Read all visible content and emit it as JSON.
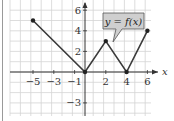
{
  "chart_data": {
    "type": "line",
    "title": "",
    "xlabel": "x",
    "ylabel": "",
    "annotation": "y = f(x)",
    "x": [
      -5,
      0,
      2,
      4,
      6
    ],
    "series": [
      {
        "name": "f(x)",
        "x": [
          -5,
          0,
          2,
          4,
          6
        ],
        "y": [
          5,
          0,
          3,
          0,
          4
        ]
      }
    ],
    "x_ticks": [
      "-5",
      "-3",
      "-1",
      "2",
      "4",
      "6"
    ],
    "y_ticks": [
      "6",
      "4",
      "2",
      "-3"
    ],
    "xlim": [
      -7,
      6.5
    ],
    "ylim": [
      -4,
      7
    ],
    "grid": true,
    "legend": "none"
  },
  "colors": {
    "grid": "#d4d4d4",
    "axis": "#333333",
    "line": "#3a3a3a",
    "callout_fill": "#cfcfcf",
    "callout_stroke": "#555555"
  }
}
